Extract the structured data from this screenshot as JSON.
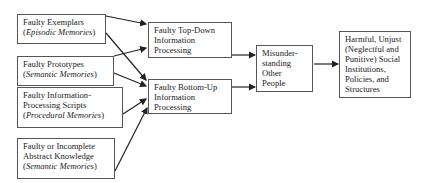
{
  "diagram": {
    "boxes": {
      "exemplars": {
        "line1": "Faulty Exemplars",
        "line2_open": "(",
        "line2_italic": "Episodic Memories",
        "line2_close": ")"
      },
      "prototypes": {
        "line1": "Faulty Prototypes",
        "line2_open": "(",
        "line2_italic": "Semantic Memories",
        "line2_close": ")"
      },
      "scripts": {
        "line1": "Faulty  Information-",
        "line2": "Processing Scripts",
        "line3_open": "(",
        "line3_italic": "Procedural Memories",
        "line3_close": ")"
      },
      "abstract": {
        "line1": "Faulty or Incomplete",
        "line2": "Abstract Knowledge",
        "line3_open": "(",
        "line3_italic": "Semantic Memories",
        "line3_close": ")"
      },
      "topdown": {
        "line1": "Faulty Top-Down",
        "line2": "Information",
        "line3": "Processing"
      },
      "bottomup": {
        "line1": "Faulty Bottom-Up",
        "line2": "Information",
        "line3": "Processing"
      },
      "misunderstanding": {
        "line1": "Misunder-",
        "line2": "standing",
        "line3": "Other",
        "line4": "People"
      },
      "harmful": {
        "line1": "Harmful, Unjust",
        "line2": "(Neglectful and",
        "line3": "Punitive) Social",
        "line4": "Institutions,",
        "line5": "Policies, and",
        "line6": "Structures"
      }
    },
    "colors": {
      "border": "#555555",
      "arrow": "#222222",
      "text": "#222222"
    }
  }
}
